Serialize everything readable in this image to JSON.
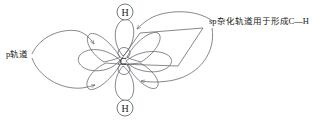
{
  "figure": {
    "stroke_color": "#55555c",
    "text_color": "#1a1a1a",
    "background_color": "#ffffff",
    "width": 321,
    "height": 120
  },
  "atoms": {
    "center": {
      "symbol": "C",
      "x": 123,
      "y": 61
    },
    "hydrogen_top": {
      "symbol": "H",
      "x": 125,
      "y": 12,
      "circle_radius": 8
    },
    "hydrogen_bottom": {
      "symbol": "H",
      "x": 125,
      "y": 108,
      "circle_radius": 8
    }
  },
  "labels": {
    "p_orbital": {
      "text": "p轨道",
      "x": 6,
      "y": 50
    },
    "sp_hybrid": {
      "text": "sp杂化轨道用于形成C—H",
      "x": 209,
      "y": 17
    }
  },
  "orbitals": {
    "sp_hybrid_lobes": [
      {
        "name": "sp-lobe-up",
        "direction": "up"
      },
      {
        "name": "sp-lobe-down",
        "direction": "down"
      }
    ],
    "p_orbital_lobes": [
      {
        "name": "p-lobe-left",
        "direction": "left"
      },
      {
        "name": "p-lobe-right",
        "direction": "right"
      },
      {
        "name": "p-lobe-upper-left",
        "direction": "upper-left"
      },
      {
        "name": "p-lobe-upper-right",
        "direction": "upper-right"
      },
      {
        "name": "p-lobe-lower-left",
        "direction": "lower-left"
      },
      {
        "name": "p-lobe-lower-right",
        "direction": "lower-right"
      }
    ]
  },
  "annotations": {
    "plane": {
      "name": "reference-plane-parallelogram"
    },
    "arrows": [
      {
        "name": "arrow-p-to-upper-lobe",
        "from": "p轨道",
        "to": "upper diagonal p lobe"
      },
      {
        "name": "arrow-p-to-lower-lobe",
        "from": "p轨道",
        "to": "lower diagonal p lobe"
      },
      {
        "name": "arrow-sp-to-top-lobe",
        "from": "sp杂化轨道用于形成C—H",
        "to": "top sp lobe"
      },
      {
        "name": "arrow-sp-to-bottom-lobe",
        "from": "sp杂化轨道用于形成C—H",
        "to": "bottom sp lobe"
      }
    ]
  }
}
